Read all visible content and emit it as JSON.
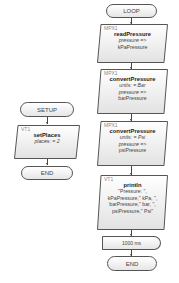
{
  "loop": {
    "start_label": "LOOP",
    "blocks": [
      {
        "tag": "MPX1",
        "function": "readPressure",
        "lines": [
          {
            "text": "pressure =>",
            "italic": true
          },
          {
            "text": "kPaPressure",
            "italic": false
          }
        ]
      },
      {
        "tag": "MPX1",
        "function": "convertPressure",
        "lines": [
          {
            "text": "units: = Bar",
            "italic": true
          },
          {
            "text": "pressure =>",
            "italic": true
          },
          {
            "text": "barPressure",
            "italic": false
          }
        ]
      },
      {
        "tag": "MPX1",
        "function": "convertPressure",
        "lines": [
          {
            "text": "units: = Psi",
            "italic": true
          },
          {
            "text": "pressure =>",
            "italic": true
          },
          {
            "text": "psiPressure",
            "italic": false
          }
        ]
      },
      {
        "tag": "VT1",
        "function": "println",
        "lines": [
          {
            "text": "\"Pressure: \",",
            "italic": false
          },
          {
            "text": "kPaPressure,\" kPa, \",",
            "italic": false
          },
          {
            "text": "barPressure,\" bar, \",",
            "italic": false
          },
          {
            "text": "psiPressure,\" Psi\"",
            "italic": false
          }
        ]
      }
    ],
    "delay_label": "1000 ms",
    "end_label": "END"
  },
  "setup": {
    "start_label": "SETUP",
    "blocks": [
      {
        "tag": "VT1",
        "function": "setPlaces",
        "lines": [
          {
            "text": "places: = 2",
            "italic": true
          }
        ]
      }
    ],
    "end_label": "END"
  },
  "colors": {
    "border": "#555555",
    "fill_top": "#ffffff",
    "fill_bottom": "#e6e6e6"
  }
}
